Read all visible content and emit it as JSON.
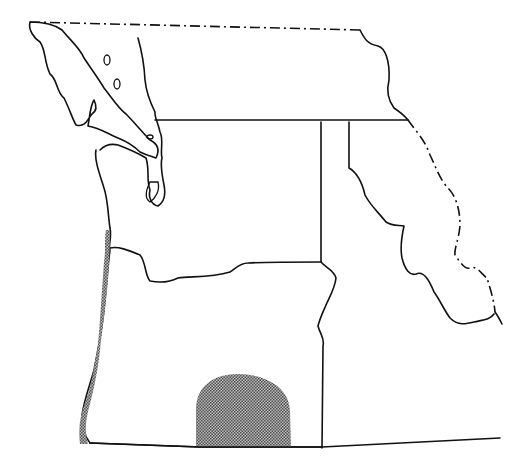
{
  "map": {
    "title": "",
    "description": "Outline map of the Pacific Northwest (Washington, Oregon, Idaho) showing species distribution as stippled areas",
    "regions": [
      "Washington",
      "Oregon",
      "Idaho",
      "Vancouver Island"
    ],
    "shaded_areas": [
      {
        "name": "coastal-strip",
        "description": "narrow stippled band along the Pacific coast from southern Washington to southern Oregon"
      },
      {
        "name": "south-central-oregon",
        "description": "dome-shaped stippled area along the southern Oregon border"
      }
    ],
    "colors": {
      "outline": "#111111",
      "stipple": "#7a7a7a",
      "background": "#ffffff"
    },
    "line_styles": {
      "state_boundaries": "solid",
      "international_and_continental_divide": "dash-dot"
    }
  }
}
